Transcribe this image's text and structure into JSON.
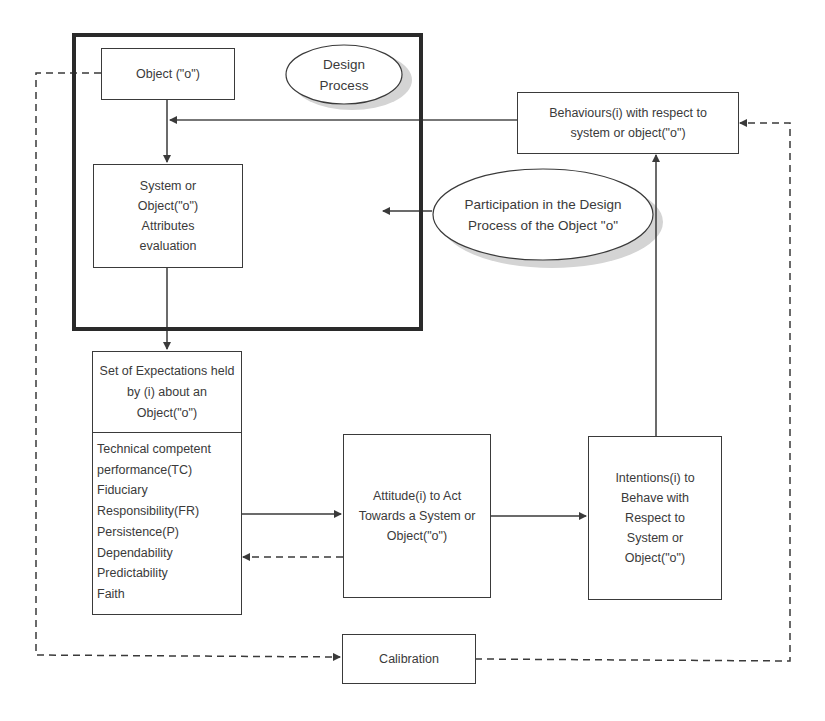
{
  "diagram": {
    "design_process_label": "Design Process",
    "participation_label": "Participation in the Design Process of the Object \"o\"",
    "nodes": {
      "object": "Object (\"o\")",
      "attributes": "System or Object(\"o\") Attributes evaluation",
      "expectations_header": "Set of Expectations held by (i)  about an Object(\"o\")",
      "expectations_items": [
        "Technical competent",
        "performance(TC)",
        "Fiduciary",
        "Responsibility(FR)",
        "Persistence(P)",
        "Dependability",
        "Predictability",
        "Faith"
      ],
      "attitude": "Attitude(i) to Act Towards a System or Object(\"o\")",
      "intentions": "Intentions(i) to Behave with Respect to System or Object(\"o\")",
      "behaviours": "Behaviours(i) with respect to system or object(\"o\")",
      "calibration": "Calibration"
    },
    "edges": [
      {
        "from": "object",
        "to": "attributes",
        "style": "solid"
      },
      {
        "from": "attributes",
        "to": "expectations",
        "style": "solid"
      },
      {
        "from": "expectations",
        "to": "attitude",
        "style": "solid"
      },
      {
        "from": "attitude",
        "to": "expectations",
        "style": "dashed"
      },
      {
        "from": "attitude",
        "to": "intentions",
        "style": "solid"
      },
      {
        "from": "intentions",
        "to": "behaviours",
        "style": "solid"
      },
      {
        "from": "behaviours",
        "to": "object-attributes-link",
        "style": "solid"
      },
      {
        "from": "participation",
        "to": "design-process",
        "style": "solid"
      },
      {
        "from": "object",
        "to": "calibration",
        "style": "dashed"
      },
      {
        "from": "calibration",
        "to": "behaviours",
        "style": "dashed"
      }
    ],
    "colors": {
      "line": "#3a3a3a",
      "frame": "#2a2a2a",
      "ellipse_shadow": "#cfcfcf"
    }
  }
}
